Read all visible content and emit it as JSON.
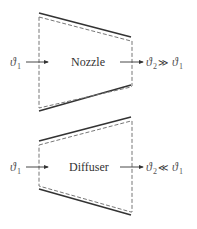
{
  "diagrams": [
    {
      "name": "Nozzle",
      "label": "Nozzle",
      "inlet": {
        "symbol": "ϑ",
        "subscript": "1"
      },
      "outlet": {
        "symbol": "ϑ",
        "subscript": "2"
      },
      "relation": "≫",
      "compare": {
        "symbol": "ϑ",
        "subscript": "1"
      },
      "shape": "converging"
    },
    {
      "name": "Diffuser",
      "label": "Diffuser",
      "inlet": {
        "symbol": "ϑ",
        "subscript": "1"
      },
      "outlet": {
        "symbol": "ϑ",
        "subscript": "2"
      },
      "relation": "≪",
      "compare": {
        "symbol": "ϑ",
        "subscript": "1"
      },
      "shape": "diverging"
    }
  ],
  "colors": {
    "line": "#333333",
    "dashed": "#777777",
    "text": "#333333"
  }
}
